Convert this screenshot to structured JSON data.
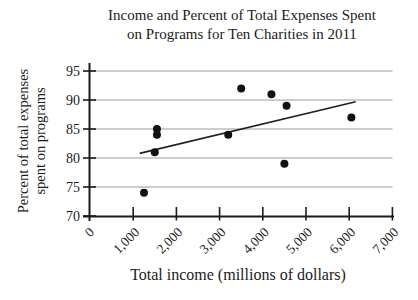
{
  "title": {
    "line1": "Income and Percent of Total Expenses Spent",
    "line2": "on Programs for Ten Charities in 2011"
  },
  "axes": {
    "x_label": "Total income (millions of dollars)",
    "y_label_line1": "Percent of total expenses",
    "y_label_line2": "spent on programs"
  },
  "chart_data": {
    "type": "scatter",
    "title": "Income and Percent of Total Expenses Spent on Programs for Ten Charities in 2011",
    "xlabel": "Total income (millions of dollars)",
    "ylabel": "Percent of total expenses spent on programs",
    "xlim": [
      0,
      7000
    ],
    "ylim": [
      70,
      95
    ],
    "grid": "horizontal",
    "legend": "none",
    "x_ticks": [
      {
        "value": 0,
        "label": "0"
      },
      {
        "value": 1000,
        "label": "1,000"
      },
      {
        "value": 2000,
        "label": "2,000"
      },
      {
        "value": 3000,
        "label": "3,000"
      },
      {
        "value": 4000,
        "label": "4,000"
      },
      {
        "value": 5000,
        "label": "5,000"
      },
      {
        "value": 6000,
        "label": "6,000"
      },
      {
        "value": 7000,
        "label": "7,000"
      }
    ],
    "y_ticks": [
      {
        "value": 70,
        "label": "70"
      },
      {
        "value": 75,
        "label": "75"
      },
      {
        "value": 80,
        "label": "80"
      },
      {
        "value": 85,
        "label": "85"
      },
      {
        "value": 90,
        "label": "90"
      },
      {
        "value": 95,
        "label": "95"
      }
    ],
    "points": [
      {
        "x": 1250,
        "y": 74
      },
      {
        "x": 1500,
        "y": 81
      },
      {
        "x": 1550,
        "y": 84
      },
      {
        "x": 1550,
        "y": 85
      },
      {
        "x": 3200,
        "y": 84
      },
      {
        "x": 3500,
        "y": 92
      },
      {
        "x": 4200,
        "y": 91
      },
      {
        "x": 4550,
        "y": 89
      },
      {
        "x": 4500,
        "y": 79
      },
      {
        "x": 6050,
        "y": 87
      }
    ],
    "trend_line": {
      "x1": 1150,
      "y1": 80.8,
      "x2": 6150,
      "y2": 89.7
    },
    "colors": {
      "background": "#ffffff",
      "text": "#1b1b1b",
      "axis": "#1b1b1b",
      "gridline": "#9c9c9c",
      "point": "#111111",
      "trend_line": "#222222"
    }
  }
}
